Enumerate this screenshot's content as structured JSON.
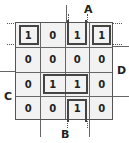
{
  "diagram": {
    "type": "karnaugh-map",
    "variables": {
      "A": "A",
      "B": "B",
      "C": "C",
      "D": "D"
    },
    "cells": [
      [
        "1",
        "0",
        "1",
        "1"
      ],
      [
        "0",
        "0",
        "0",
        "0"
      ],
      [
        "0",
        "1",
        "1",
        "0"
      ],
      [
        "0",
        "0",
        "1",
        "0"
      ]
    ],
    "groups": [
      {
        "name": "corner-group-left",
        "row": 0,
        "col": 0,
        "rows": 1,
        "cols": 1
      },
      {
        "name": "corner-group-right",
        "row": 0,
        "col": 3,
        "rows": 1,
        "cols": 1
      },
      {
        "name": "top-col2-group",
        "row": 0,
        "col": 2,
        "rows": 1,
        "cols": 1
      },
      {
        "name": "row2-pair-group",
        "row": 2,
        "col": 1,
        "rows": 1,
        "cols": 2
      },
      {
        "name": "bottom-col2-group",
        "row": 3,
        "col": 2,
        "rows": 1,
        "cols": 1
      }
    ]
  }
}
